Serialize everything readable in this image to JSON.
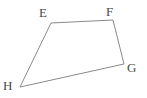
{
  "figure": {
    "kind": "geometry-diagram",
    "shape_name": "quadrilateral",
    "background_color": "#ffffff",
    "stroke_color": "#8a8a8a",
    "stroke_width": 1,
    "label_color": "#4a4a4a",
    "canvas": {
      "width": 147,
      "height": 98
    },
    "vertices": [
      {
        "id": "E",
        "label": "E",
        "x": 51,
        "y": 23,
        "label_x": 39,
        "label_y": 6
      },
      {
        "id": "F",
        "label": "F",
        "x": 113,
        "y": 20,
        "label_x": 106,
        "label_y": 5
      },
      {
        "id": "G",
        "label": "G",
        "x": 124,
        "y": 64,
        "label_x": 127,
        "label_y": 61
      },
      {
        "id": "H",
        "label": "H",
        "x": 20,
        "y": 87,
        "label_x": 3,
        "label_y": 79
      }
    ],
    "edges": [
      {
        "id": "EF",
        "from": "E",
        "to": "F"
      },
      {
        "id": "FG",
        "from": "F",
        "to": "G"
      },
      {
        "id": "GH",
        "from": "G",
        "to": "H"
      },
      {
        "id": "HE",
        "from": "H",
        "to": "E"
      }
    ],
    "polygon_points": "51,23 113,20 124,64 20,87"
  }
}
